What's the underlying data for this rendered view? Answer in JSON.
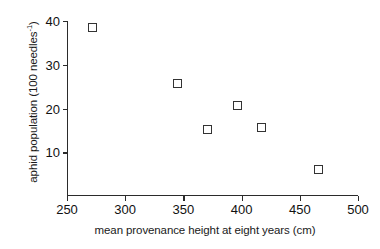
{
  "chart_data": {
    "type": "scatter",
    "title": "",
    "xlabel": "mean provenance height at eight years (cm)",
    "ylabel_plain": "aphid population (100 needles-1)",
    "ylabel_prefix": "aphid population (100 needles",
    "ylabel_superscript": "-1",
    "ylabel_suffix": ")",
    "xlim": [
      250,
      500
    ],
    "ylim": [
      0,
      40
    ],
    "xticks": [
      250,
      300,
      350,
      400,
      450,
      500
    ],
    "yticks": [
      10,
      20,
      30,
      40
    ],
    "xtick_labels": [
      "250",
      "300",
      "350",
      "400",
      "450",
      "500"
    ],
    "ytick_labels": [
      "10",
      "20",
      "30",
      "40"
    ],
    "grid": false,
    "legend": false,
    "marker": "open-square",
    "marker_color": "#333333",
    "marker_fill": "#ffffff",
    "axis_color": "#2b2b2b",
    "points": [
      {
        "x": 271,
        "y": 38.7
      },
      {
        "x": 344,
        "y": 26.0
      },
      {
        "x": 370,
        "y": 15.5
      },
      {
        "x": 396,
        "y": 21.0
      },
      {
        "x": 416,
        "y": 16.0
      },
      {
        "x": 465,
        "y": 6.3
      }
    ]
  }
}
